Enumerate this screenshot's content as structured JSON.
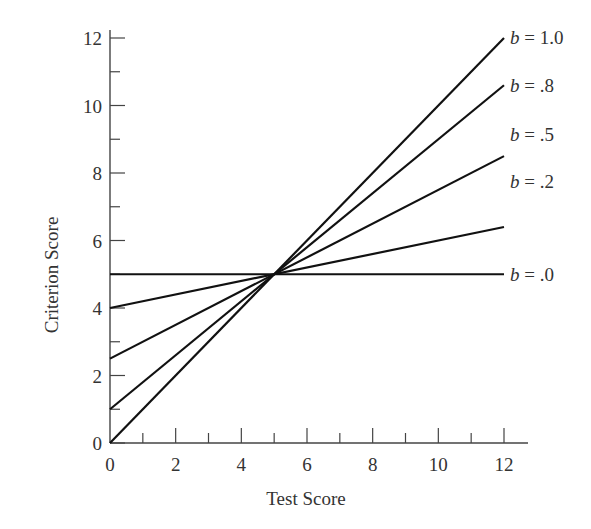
{
  "chart_data": {
    "type": "line",
    "title": "",
    "xlabel": "Test Score",
    "ylabel": "Criterion Score",
    "xlim": [
      0,
      12
    ],
    "ylim": [
      0,
      12
    ],
    "x_ticks": [
      "0",
      "2",
      "4",
      "6",
      "8",
      "10",
      "12"
    ],
    "y_ticks": [
      "0",
      "2",
      "4",
      "6",
      "8",
      "10",
      "12"
    ],
    "grid": false,
    "legend_position": "inline-right",
    "series": [
      {
        "name": "b = 1.0",
        "slope": 1.0,
        "x": [
          0,
          12
        ],
        "values": [
          0,
          12
        ]
      },
      {
        "name": "b = .8",
        "slope": 0.8,
        "x": [
          0,
          12
        ],
        "values": [
          1,
          10.6
        ]
      },
      {
        "name": "b = .5",
        "slope": 0.5,
        "x": [
          0,
          12
        ],
        "values": [
          2.5,
          8.5
        ]
      },
      {
        "name": "b = .2",
        "slope": 0.2,
        "x": [
          0,
          12
        ],
        "values": [
          4,
          6.4
        ]
      },
      {
        "name": "b = .0",
        "slope": 0.0,
        "x": [
          0,
          12
        ],
        "values": [
          5,
          5
        ]
      }
    ]
  },
  "labels": {
    "b10": {
      "var": "b",
      "rest": " = 1.0"
    },
    "b08": {
      "var": "b",
      "rest": " = .8"
    },
    "b05": {
      "var": "b",
      "rest": " = .5"
    },
    "b02": {
      "var": "b",
      "rest": " = .2"
    },
    "b00": {
      "var": "b",
      "rest": " = .0"
    }
  }
}
